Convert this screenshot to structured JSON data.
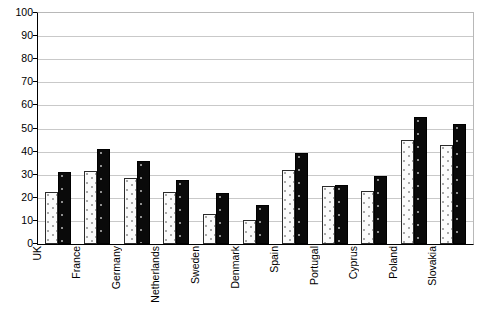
{
  "chart_data": {
    "type": "bar",
    "title": "",
    "subtitle": "",
    "xlabel": "",
    "ylabel": "",
    "ylim": [
      0,
      100
    ],
    "xlim": null,
    "grid": true,
    "legend": null,
    "legend_position": "none",
    "annotations": [],
    "categories": [
      "UK",
      "France",
      "Germany",
      "Netherlands",
      "Sweden",
      "Denmark",
      "Spain",
      "Portugal",
      "Cyprus",
      "Poland",
      "Slovakia"
    ],
    "y_ticks": [
      0,
      10,
      20,
      30,
      40,
      50,
      60,
      70,
      80,
      90,
      100
    ],
    "series": [
      {
        "name": "series-1-light-dotted",
        "values": [
          22.5,
          31.5,
          28.5,
          22.5,
          13,
          10.5,
          32,
          25,
          23,
          45,
          43
        ]
      },
      {
        "name": "series-2-black",
        "values": [
          31,
          41,
          36,
          27.5,
          22,
          17,
          39.5,
          25.5,
          29.5,
          55,
          52
        ]
      }
    ]
  }
}
